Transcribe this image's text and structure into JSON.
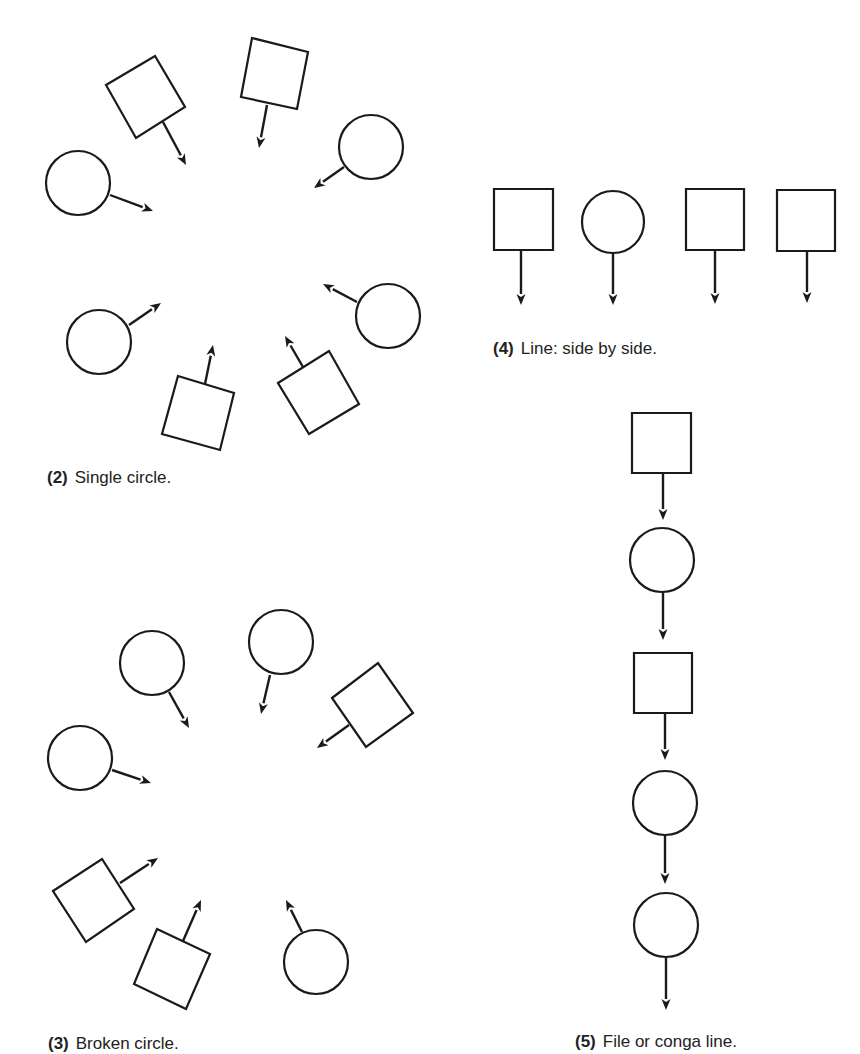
{
  "colors": {
    "ink": "#1a1a1a",
    "paper": "#ffffff",
    "text": "#222222"
  },
  "figures": [
    {
      "id": "single-circle",
      "number": "(2)",
      "caption": "Single circle.",
      "caption_pos": {
        "x": 47,
        "y": 469
      },
      "people": [
        {
          "shape": "square",
          "points": [
            [
              106,
              85
            ],
            [
              155,
              56
            ],
            [
              185,
              107
            ],
            [
              136,
              138
            ]
          ],
          "arrow": [
            [
              163,
              122
            ],
            [
              186,
              165
            ]
          ]
        },
        {
          "shape": "square",
          "points": [
            [
              252,
              38
            ],
            [
              308,
              52
            ],
            [
              297,
              109
            ],
            [
              241,
              97
            ]
          ],
          "arrow": [
            [
              267,
              105
            ],
            [
              259,
              148
            ]
          ]
        },
        {
          "shape": "circle",
          "cx": 371,
          "cy": 147,
          "r": 32,
          "arrow": [
            [
              344,
              167
            ],
            [
              314,
              188
            ]
          ]
        },
        {
          "shape": "circle",
          "cx": 78,
          "cy": 183,
          "r": 32,
          "arrow": [
            [
              110,
              195
            ],
            [
              153,
              211
            ]
          ]
        },
        {
          "shape": "circle",
          "cx": 388,
          "cy": 316,
          "r": 32,
          "arrow": [
            [
              357,
              302
            ],
            [
              323,
              284
            ]
          ]
        },
        {
          "shape": "circle",
          "cx": 99,
          "cy": 342,
          "r": 32,
          "arrow": [
            [
              129,
              325
            ],
            [
              161,
              303
            ]
          ]
        },
        {
          "shape": "square",
          "points": [
            [
              178,
              376
            ],
            [
              234,
              393
            ],
            [
              220,
              450
            ],
            [
              162,
              434
            ]
          ],
          "arrow": [
            [
              205,
              384
            ],
            [
              213,
              345
            ]
          ]
        },
        {
          "shape": "square",
          "points": [
            [
              278,
              383
            ],
            [
              329,
              351
            ],
            [
              359,
              404
            ],
            [
              309,
              434
            ]
          ],
          "arrow": [
            [
              303,
              367
            ],
            [
              285,
              336
            ]
          ]
        }
      ]
    },
    {
      "id": "broken-circle",
      "number": "(3)",
      "caption": "Broken circle.",
      "caption_pos": {
        "x": 48,
        "y": 1035
      },
      "people": [
        {
          "shape": "circle",
          "cx": 152,
          "cy": 663,
          "r": 32,
          "arrow": [
            [
              169,
              692
            ],
            [
              189,
              728
            ]
          ]
        },
        {
          "shape": "circle",
          "cx": 281,
          "cy": 642,
          "r": 32,
          "arrow": [
            [
              270,
              675
            ],
            [
              261,
              714
            ]
          ]
        },
        {
          "shape": "square",
          "points": [
            [
              332,
              698
            ],
            [
              378,
              663
            ],
            [
              413,
              713
            ],
            [
              366,
              747
            ]
          ],
          "arrow": [
            [
              349,
              725
            ],
            [
              317,
              748
            ]
          ]
        },
        {
          "shape": "circle",
          "cx": 80,
          "cy": 758,
          "r": 32,
          "arrow": [
            [
              112,
              770
            ],
            [
              151,
              783
            ]
          ]
        },
        {
          "shape": "square",
          "points": [
            [
              53,
              891
            ],
            [
              102,
              859
            ],
            [
              134,
              909
            ],
            [
              86,
              942
            ]
          ],
          "arrow": [
            [
              120,
              883
            ],
            [
              158,
              858
            ]
          ]
        },
        {
          "shape": "square",
          "points": [
            [
              157,
              929
            ],
            [
              210,
              954
            ],
            [
              186,
              1009
            ],
            [
              134,
              984
            ]
          ],
          "arrow": [
            [
              183,
              941
            ],
            [
              201,
              900
            ]
          ]
        },
        {
          "shape": "circle",
          "cx": 316,
          "cy": 962,
          "r": 32,
          "arrow": [
            [
              302,
              932
            ],
            [
              286,
              900
            ]
          ]
        }
      ]
    },
    {
      "id": "line-side-by-side",
      "number": "(4)",
      "caption": "Line: side by side.",
      "caption_pos": {
        "x": 493,
        "y": 340
      },
      "people": [
        {
          "shape": "square",
          "points": [
            [
              494,
              189
            ],
            [
              553,
              189
            ],
            [
              553,
              250
            ],
            [
              494,
              250
            ]
          ],
          "arrow": [
            [
              521,
              250
            ],
            [
              521,
              305
            ]
          ]
        },
        {
          "shape": "circle",
          "cx": 613,
          "cy": 222,
          "r": 31,
          "arrow": [
            [
              613,
              253
            ],
            [
              613,
              305
            ]
          ]
        },
        {
          "shape": "square",
          "points": [
            [
              686,
              189
            ],
            [
              744,
              189
            ],
            [
              744,
              250
            ],
            [
              686,
              250
            ]
          ],
          "arrow": [
            [
              715,
              250
            ],
            [
              715,
              304
            ]
          ]
        },
        {
          "shape": "square",
          "points": [
            [
              777,
              190
            ],
            [
              835,
              190
            ],
            [
              835,
              251
            ],
            [
              777,
              251
            ]
          ],
          "arrow": [
            [
              807,
              251
            ],
            [
              807,
              303
            ]
          ]
        }
      ]
    },
    {
      "id": "file-conga-line",
      "number": "(5)",
      "caption": "File or conga line.",
      "caption_pos": {
        "x": 575,
        "y": 1033
      },
      "people": [
        {
          "shape": "square",
          "points": [
            [
              632,
              413
            ],
            [
              691,
              413
            ],
            [
              691,
              473
            ],
            [
              632,
              473
            ]
          ],
          "arrow": [
            [
              663,
              473
            ],
            [
              663,
              520
            ]
          ]
        },
        {
          "shape": "circle",
          "cx": 662,
          "cy": 560,
          "r": 32,
          "arrow": [
            [
              663,
              592
            ],
            [
              663,
              640
            ]
          ]
        },
        {
          "shape": "square",
          "points": [
            [
              634,
              653
            ],
            [
              692,
              653
            ],
            [
              692,
              713
            ],
            [
              634,
              713
            ]
          ],
          "arrow": [
            [
              665,
              713
            ],
            [
              665,
              760
            ]
          ]
        },
        {
          "shape": "circle",
          "cx": 665,
          "cy": 803,
          "r": 32,
          "arrow": [
            [
              665,
              835
            ],
            [
              665,
              884
            ]
          ]
        },
        {
          "shape": "circle",
          "cx": 666,
          "cy": 925,
          "r": 32,
          "arrow": [
            [
              666,
              958
            ],
            [
              666,
              1010
            ]
          ]
        }
      ]
    }
  ]
}
